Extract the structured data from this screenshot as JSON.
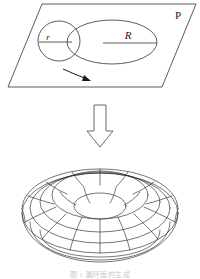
{
  "figure": {
    "stroke_color": "#2b2b2b",
    "faint_color": "#c9c9c9"
  },
  "plane": {
    "label": "P",
    "label_x": 178,
    "label_y": 18,
    "corners": "42,4 196,4 162,87 8,87"
  },
  "generating_circle": {
    "name": "small circle",
    "cx": 59,
    "cy": 41,
    "rx": 21,
    "ry": 20,
    "radius_label": "r",
    "radius_label_x": 48,
    "radius_label_y": 40,
    "radius_line": {
      "x1": 39,
      "y1": 42,
      "x2": 72,
      "y2": 42
    }
  },
  "revolution_ellipse": {
    "name": "large ellipse",
    "cx": 112,
    "cy": 42,
    "rx": 45,
    "ry": 22,
    "radius_label": "R",
    "radius_label_x": 128,
    "radius_label_y": 39,
    "radius_line": {
      "x1": 103,
      "y1": 43,
      "x2": 157,
      "y2": 43
    }
  },
  "rotation_arrow": {
    "name": "rotation direction arrow",
    "path": "M 64 70 C 72 73 80 76 88 79"
  },
  "transform_arrow": {
    "name": "downward hollow arrow",
    "outline": "94,105 106,105 106,131 113,131 100,147 87,131 94,131"
  },
  "torus": {
    "name": "wireframe torus",
    "center_x": 100,
    "center_y": 213,
    "outer_rx": 78,
    "outer_ry": 50,
    "hole_rx": 26,
    "hole_ry": 14,
    "tube_segments": 16,
    "ring_segments": 12
  },
  "caption": {
    "text": "图 1  圆环面的生成"
  }
}
